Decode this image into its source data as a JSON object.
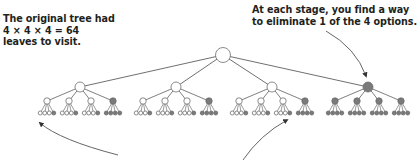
{
  "annotations": {
    "left": "The original tree had\n4 × 4 × 4 = 64\nleaves to visit.",
    "right": "At each stage, you find a way\nto eliminate 1 of the 4 options."
  },
  "tree": {
    "branching_factor": 4,
    "depth": 3,
    "total_leaves": 64,
    "colors": {
      "kept_fill": "#ffffff",
      "eliminated_fill": "#7a7a7a",
      "stroke": "#6d6d6d",
      "edge": "#707070",
      "arrow": "#555555"
    },
    "root": {
      "x": 223,
      "y": 55,
      "r": 7.5,
      "eliminated": false
    },
    "level1": [
      {
        "x": 80,
        "y": 87,
        "r": 5,
        "eliminated": false
      },
      {
        "x": 176,
        "y": 87,
        "r": 5,
        "eliminated": false
      },
      {
        "x": 272,
        "y": 87,
        "r": 5,
        "eliminated": false
      },
      {
        "x": 368,
        "y": 87,
        "r": 5,
        "eliminated": true
      }
    ],
    "level2_offsets": [
      -33,
      -11,
      11,
      33
    ],
    "level2_y": 101,
    "level2_r": 3.2,
    "leaf_offsets": [
      -6.75,
      -2.25,
      2.25,
      6.75
    ],
    "leaf_y": 113,
    "leaf_r": 2
  },
  "arrows": [
    {
      "name": "arrow-to-eliminated-branch",
      "path": "M 326 31 Q 356 48 366 76"
    },
    {
      "name": "arrow-to-first-leaf",
      "path": "M 118 155 Q 60 140 40 123"
    },
    {
      "name": "arrow-to-third-group-leaf",
      "path": "M 243 160 Q 260 135 287 120"
    }
  ]
}
